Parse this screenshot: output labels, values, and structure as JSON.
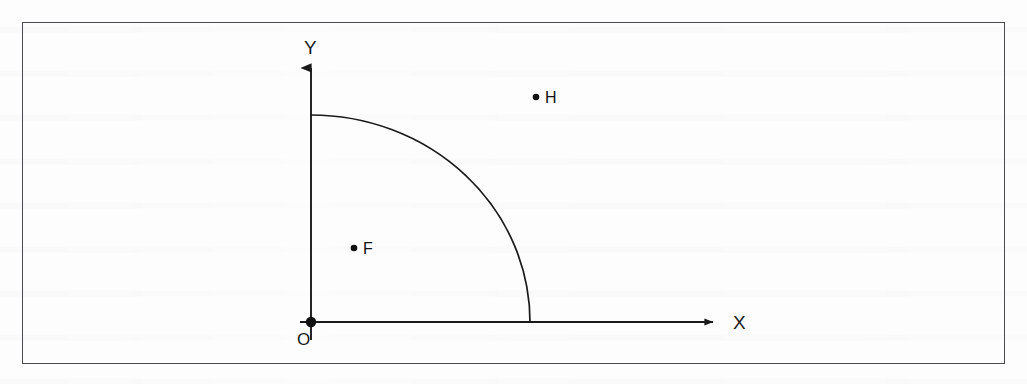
{
  "figure": {
    "title": "",
    "background_color": "#fdfdfd",
    "frame_color": "#4a4a4f",
    "ink_color": "#1a1a1a"
  },
  "axes": {
    "x_label": "X",
    "y_label": "Y",
    "origin_label": "O",
    "x_axis": {
      "start_x": 300,
      "end_x": 717,
      "y": 322,
      "arrow": "arrowhead-right"
    },
    "y_axis": {
      "x": 311,
      "start_y": 340,
      "end_y": 62,
      "arrow": "arrowhead-up"
    }
  },
  "curve": {
    "type": "quarter-arc",
    "center": {
      "x": 311,
      "y": 322
    },
    "radius_x": 219,
    "radius_y": 207,
    "start_point": {
      "x": 311,
      "y": 115
    },
    "end_point": {
      "x": 530,
      "y": 322
    },
    "stroke_color": "#1a1a1a"
  },
  "points": [
    {
      "name": "H",
      "label": "H",
      "dot_x": 536,
      "dot_y": 97,
      "label_x": 545,
      "label_y": 103,
      "position": "outside-arc"
    },
    {
      "name": "F",
      "label": "F",
      "dot_x": 354,
      "dot_y": 248,
      "label_x": 363,
      "label_y": 254,
      "position": "inside-arc"
    }
  ],
  "origin_point": {
    "dot_x": 311,
    "dot_y": 322,
    "label_x": 297,
    "label_y": 345
  }
}
